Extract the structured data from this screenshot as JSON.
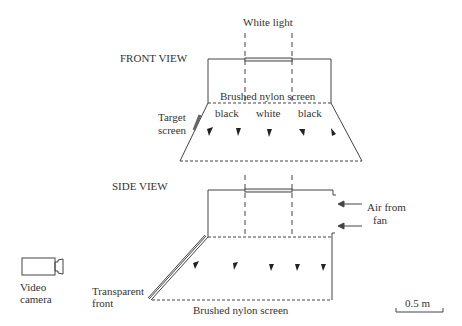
{
  "labels": {
    "white_light": "White light",
    "front_view": "FRONT VIEW",
    "side_view": "SIDE VIEW",
    "brushed_nylon_front": "Brushed nylon screen",
    "brushed_nylon_side": "Brushed nylon screen",
    "black_left": "black",
    "white_mid": "white",
    "black_right": "black",
    "target_screen_1": "Target",
    "target_screen_2": "screen",
    "air_from_1": "Air from",
    "air_from_2": "fan",
    "video_1": "Video",
    "video_2": "camera",
    "transparent_1": "Transparent",
    "transparent_2": "front",
    "scale": "0.5 m"
  }
}
